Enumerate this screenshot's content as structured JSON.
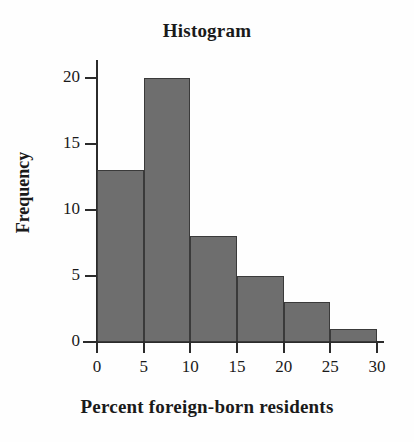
{
  "chart_data": {
    "type": "bar",
    "title": "Histogram",
    "xlabel": "Percent foreign-born residents",
    "ylabel": "Frequency",
    "categories": [
      "0-5",
      "5-10",
      "10-15",
      "15-20",
      "20-25",
      "25-30"
    ],
    "bin_edges": [
      0,
      5,
      10,
      15,
      20,
      25,
      30
    ],
    "values": [
      13,
      20,
      8,
      5,
      3,
      1
    ],
    "bin_width": 5,
    "xlim": [
      0,
      30
    ],
    "ylim": [
      0,
      21.2
    ],
    "xticks": [
      "0",
      "5",
      "10",
      "15",
      "20",
      "25",
      "30"
    ],
    "xtick_values": [
      0,
      5,
      10,
      15,
      20,
      25,
      30
    ],
    "yticks": [
      "0",
      "5",
      "10",
      "15",
      "20"
    ],
    "ytick_values": [
      0,
      5,
      10,
      15,
      20
    ],
    "grid": false,
    "legend": null,
    "bar_fill_color": "#6e6e6e",
    "bar_edge_color": "#3a3a3a",
    "axis_color": "#2b2b2b",
    "background_color": "#fefefe"
  }
}
